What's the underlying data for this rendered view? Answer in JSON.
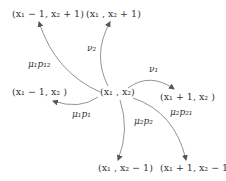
{
  "diagram": {
    "center": {
      "id": "center",
      "text": "(x₁ , x₂)"
    },
    "nodes": [
      {
        "id": "up_left",
        "text": "(x₁ − 1, x₂ + 1)"
      },
      {
        "id": "up",
        "text": "(x₁ , x₂ + 1)"
      },
      {
        "id": "left",
        "text": "(x₁ − 1, x₂ )"
      },
      {
        "id": "right",
        "text": "(x₁ + 1, x₂ )"
      },
      {
        "id": "down",
        "text": "(x₁ , x₂ − 1)"
      },
      {
        "id": "down_right",
        "text": "(x₁ + 1, x₂ − 1)"
      }
    ],
    "edges": [
      {
        "from": "center",
        "to": "up_left",
        "label": "μ₁p₁₂"
      },
      {
        "from": "center",
        "to": "up",
        "label": "ν₂"
      },
      {
        "from": "center",
        "to": "right",
        "label": "ν₁"
      },
      {
        "from": "center",
        "to": "left",
        "label": "μ₁p₁"
      },
      {
        "from": "center",
        "to": "down",
        "label": "μ₂p₂"
      },
      {
        "from": "center",
        "to": "down_right",
        "label": "μ₂p₂₁"
      }
    ],
    "colors": {
      "stroke": "#666666",
      "text": "#333333"
    }
  }
}
